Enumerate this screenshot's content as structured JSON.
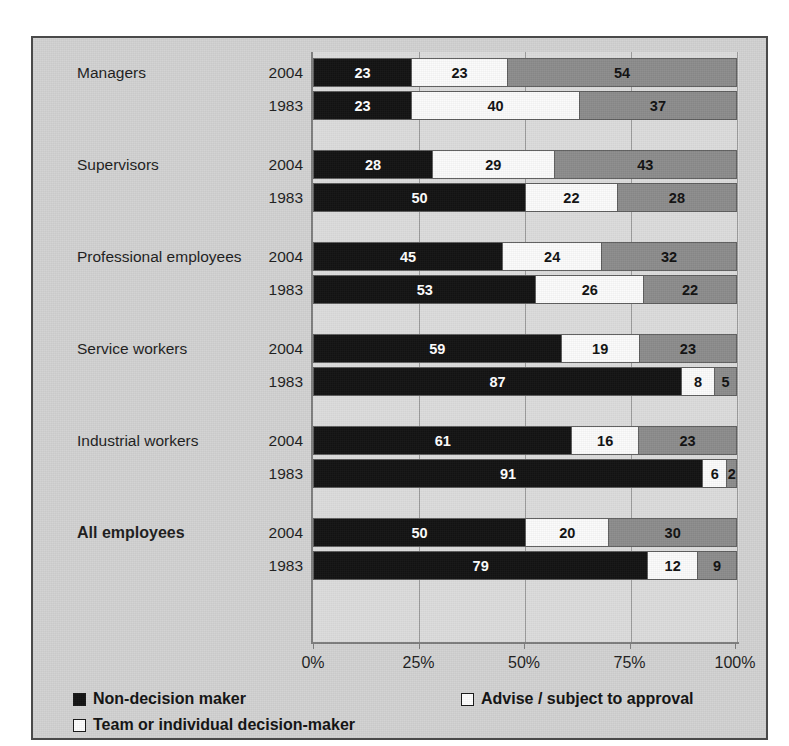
{
  "top_caption": "",
  "chart_data": {
    "type": "bar",
    "subtype": "stacked-horizontal-100percent",
    "title": "",
    "xlabel": "",
    "ylabel": "",
    "xlim": [
      0,
      100
    ],
    "xticks": [
      0,
      25,
      50,
      75,
      100
    ],
    "xtick_labels": [
      "0%",
      "25%",
      "50%",
      "75%",
      "100%"
    ],
    "grid": true,
    "legend_position": "bottom",
    "series": [
      {
        "name": "Non-decision maker",
        "key": "s0",
        "color": "#121212"
      },
      {
        "name": "Advise / subject to approval",
        "key": "s1",
        "color": "#fbfbfb"
      },
      {
        "name": "Team or individual decision-maker",
        "key": "s2",
        "color": "#8c8c8c"
      }
    ],
    "groups": [
      {
        "category": "Managers",
        "bold": false,
        "rows": [
          {
            "year": "2004",
            "values": [
              23,
              23,
              54
            ],
            "labels": [
              "23",
              "23",
              "54"
            ]
          },
          {
            "year": "1983",
            "values": [
              23,
              40,
              37
            ],
            "labels": [
              "23",
              "40",
              "37"
            ]
          }
        ]
      },
      {
        "category": "Supervisors",
        "bold": false,
        "rows": [
          {
            "year": "2004",
            "values": [
              28,
              29,
              43
            ],
            "labels": [
              "28",
              "29",
              "43"
            ]
          },
          {
            "year": "1983",
            "values": [
              50,
              22,
              28
            ],
            "labels": [
              "50",
              "22",
              "28"
            ]
          }
        ]
      },
      {
        "category": "Professional employees",
        "bold": false,
        "rows": [
          {
            "year": "2004",
            "values": [
              45,
              24,
              32
            ],
            "labels": [
              "45",
              "24",
              "32"
            ]
          },
          {
            "year": "1983",
            "values": [
              53,
              26,
              22
            ],
            "labels": [
              "53",
              "26",
              "22"
            ]
          }
        ]
      },
      {
        "category": "Service workers",
        "bold": false,
        "rows": [
          {
            "year": "2004",
            "values": [
              59,
              19,
              23
            ],
            "labels": [
              "59",
              "19",
              "23"
            ]
          },
          {
            "year": "1983",
            "values": [
              87,
              8,
              5
            ],
            "labels": [
              "87",
              "8",
              "5"
            ]
          }
        ]
      },
      {
        "category": "Industrial workers",
        "bold": false,
        "rows": [
          {
            "year": "2004",
            "values": [
              61,
              16,
              23
            ],
            "labels": [
              "61",
              "16",
              "23"
            ]
          },
          {
            "year": "1983",
            "values": [
              91,
              6,
              2
            ],
            "labels": [
              "91",
              "6",
              "2"
            ]
          }
        ]
      },
      {
        "category": "All employees",
        "bold": true,
        "rows": [
          {
            "year": "2004",
            "values": [
              50,
              20,
              30
            ],
            "labels": [
              "50",
              "20",
              "30"
            ]
          },
          {
            "year": "1983",
            "values": [
              79,
              12,
              9
            ],
            "labels": [
              "79",
              "12",
              "9"
            ]
          }
        ]
      }
    ]
  },
  "legend": {
    "items": [
      {
        "label": "Non-decision maker",
        "swatch": "black"
      },
      {
        "label": "Advise / subject to approval",
        "swatch": "white"
      },
      {
        "label": "Team or individual decision-maker",
        "swatch": "white"
      }
    ]
  }
}
